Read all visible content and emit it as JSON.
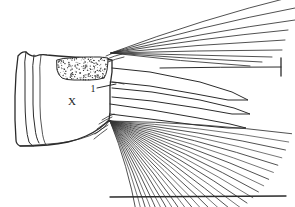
{
  "figure": {
    "kind": "scientific-line-drawing",
    "background_color": "#ffffff",
    "ink_color": "#2b2b2b",
    "width": 295,
    "height": 207,
    "labels": [
      {
        "id": "segment-label",
        "text": "X",
        "x": 72,
        "y": 105,
        "font_size": 11
      },
      {
        "id": "seta-label",
        "text": "1",
        "x": 93,
        "y": 92,
        "font_size": 10
      }
    ],
    "leader_lines": [
      {
        "id": "leader-seta-1",
        "from_x": 97,
        "from_y": 88,
        "to_x": 116,
        "to_y": 84
      }
    ],
    "structures": [
      {
        "id": "segment-x",
        "name": "anal segment X",
        "label": "X"
      },
      {
        "id": "stippled-saddle",
        "name": "stippled dorsal saddle"
      },
      {
        "id": "upper-setal-fan",
        "name": "dorsal brush setae",
        "count": 9
      },
      {
        "id": "lower-setal-fan",
        "name": "ventral brush setae",
        "count": 27
      },
      {
        "id": "lamellae",
        "name": "anal papillae / lamellae",
        "count": 3
      },
      {
        "id": "scale-tick",
        "name": "terminal seta tick mark"
      },
      {
        "id": "baseline",
        "name": "ventral baseline"
      }
    ]
  },
  "chart_data": {
    "type": "line",
    "title": "",
    "xlabel": "",
    "ylabel": "",
    "grid": false,
    "legend": "none",
    "xlim": [
      0,
      295
    ],
    "ylim": [
      0,
      207
    ],
    "note": "Coordinates are image-space pixels; y increases downward.",
    "series": [
      {
        "name": "segment-outline",
        "kind": "closed-path",
        "points": [
          [
            18,
            56
          ],
          [
            26,
            52
          ],
          [
            36,
            56
          ],
          [
            47,
            55
          ],
          [
            58,
            56
          ],
          [
            72,
            57
          ],
          [
            88,
            58
          ],
          [
            104,
            59
          ],
          [
            112,
            60
          ],
          [
            112,
            72
          ],
          [
            110,
            86
          ],
          [
            110,
            100
          ],
          [
            110,
            112
          ],
          [
            109,
            120
          ],
          [
            100,
            128
          ],
          [
            86,
            136
          ],
          [
            68,
            142
          ],
          [
            48,
            145
          ],
          [
            32,
            146
          ],
          [
            20,
            146
          ],
          [
            16,
            140
          ],
          [
            15,
            120
          ],
          [
            15,
            96
          ],
          [
            16,
            74
          ],
          [
            18,
            56
          ]
        ]
      },
      {
        "name": "segment-fold-lines",
        "kind": "open-paths",
        "paths": [
          [
            [
              26,
              52
            ],
            [
              25,
              72
            ],
            [
              25,
              100
            ],
            [
              26,
              124
            ],
            [
              29,
              142
            ],
            [
              33,
              146
            ]
          ],
          [
            [
              34,
              55
            ],
            [
              33,
              76
            ],
            [
              33,
              104
            ],
            [
              35,
              128
            ],
            [
              39,
              143
            ]
          ],
          [
            [
              41,
              55
            ],
            [
              40,
              78
            ],
            [
              40,
              106
            ],
            [
              42,
              130
            ],
            [
              46,
              145
            ]
          ]
        ]
      },
      {
        "name": "stipple-patch-outline",
        "kind": "closed-path",
        "points": [
          [
            57,
            60
          ],
          [
            70,
            58
          ],
          [
            86,
            57
          ],
          [
            100,
            57
          ],
          [
            108,
            58
          ],
          [
            107,
            70
          ],
          [
            104,
            78
          ],
          [
            90,
            80
          ],
          [
            74,
            80
          ],
          [
            62,
            78
          ],
          [
            57,
            70
          ],
          [
            57,
            60
          ]
        ]
      },
      {
        "name": "upper-setal-fan",
        "kind": "setae",
        "origin": [
          111,
          53
        ],
        "rays": [
          {
            "to": [
              295,
              -4
            ],
            "bow": -6
          },
          {
            "to": [
              295,
              8
            ],
            "bow": -5
          },
          {
            "to": [
              295,
              20
            ],
            "bow": -4
          },
          {
            "to": [
              288,
              30
            ],
            "bow": -3
          },
          {
            "to": [
              285,
              40
            ],
            "bow": -2
          },
          {
            "to": [
              282,
              50
            ],
            "bow": -1
          },
          {
            "to": [
              272,
              57
            ],
            "bow": 0
          },
          {
            "to": [
              262,
              62
            ],
            "bow": 1
          },
          {
            "to": [
              250,
              66
            ],
            "bow": 2
          }
        ]
      },
      {
        "name": "lower-setal-fan",
        "kind": "setae",
        "origin": [
          110,
          121
        ],
        "count": 27,
        "angle_start_deg": 4,
        "angle_end_deg": 74,
        "length_min": 96,
        "length_max": 182
      },
      {
        "name": "lamellae",
        "kind": "blades",
        "blades": [
          {
            "id": "lamella-upper",
            "upper": [
              [
                112,
                68
              ],
              [
                150,
                72
              ],
              [
                200,
                82
              ],
              [
                232,
                92
              ],
              [
                248,
                100
              ]
            ],
            "lower": [
              [
                112,
                82
              ],
              [
                150,
                86
              ],
              [
                196,
                94
              ],
              [
                228,
                100
              ],
              [
                248,
                100
              ]
            ]
          },
          {
            "id": "lamella-middle",
            "upper": [
              [
                112,
                88
              ],
              [
                152,
                92
              ],
              [
                200,
                100
              ],
              [
                234,
                108
              ],
              [
                250,
                114
              ]
            ],
            "lower": [
              [
                112,
                97
              ],
              [
                152,
                101
              ],
              [
                198,
                108
              ],
              [
                232,
                114
              ],
              [
                250,
                114
              ]
            ]
          },
          {
            "id": "lamella-lower",
            "upper": [
              [
                110,
                104
              ],
              [
                152,
                110
              ],
              [
                198,
                118
              ],
              [
                230,
                124
              ],
              [
                246,
                128
              ]
            ],
            "lower": [
              [
                110,
                114
              ],
              [
                150,
                119
              ],
              [
                196,
                125
              ],
              [
                228,
                128
              ],
              [
                246,
                128
              ]
            ]
          }
        ]
      },
      {
        "name": "terminal-tick",
        "kind": "tick",
        "x": 281,
        "y_top": 58,
        "y_bottom": 76,
        "stem_from": [
          160,
          68
        ],
        "stem_to": [
          281,
          67
        ]
      },
      {
        "name": "baseline",
        "kind": "line",
        "from": [
          110,
          197
        ],
        "to": [
          286,
          196
        ]
      }
    ]
  }
}
